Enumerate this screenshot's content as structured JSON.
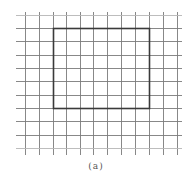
{
  "figure": {
    "caption": "(a)",
    "colors": {
      "background": "#ffffff",
      "grid_line": "#7a7a7a",
      "grid_line_light": "#b5b5b5",
      "rectangle": "#3a3a3a"
    },
    "grid": {
      "x_lines": [
        25,
        39,
        53,
        66,
        80,
        93,
        107,
        121,
        135,
        149,
        163,
        177
      ],
      "y_lines": [
        15,
        28,
        41,
        55,
        68,
        81,
        95,
        108,
        121,
        135,
        148
      ],
      "x_extent": [
        16,
        182
      ],
      "y_extent": [
        12,
        155
      ]
    },
    "rectangle": {
      "x": 53,
      "y": 28,
      "width": 96,
      "height": 80,
      "cols_spanned": 7,
      "rows_spanned": 6
    }
  }
}
